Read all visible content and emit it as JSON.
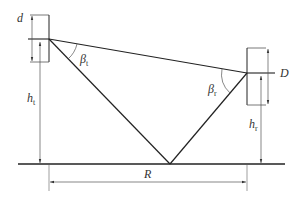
{
  "diagram": {
    "type": "two-ray ground reflection geometry",
    "labels": {
      "d": "d",
      "D": "D",
      "h_t_main": "h",
      "h_t_sub": "t",
      "h_r_main": "h",
      "h_r_sub": "r",
      "beta_t_main": "β",
      "beta_t_sub": "t",
      "beta_r_main": "β",
      "beta_r_sub": "r",
      "R": "R"
    },
    "colors": {
      "line": "#222222",
      "dimension": "#555555",
      "background": "#ffffff"
    }
  }
}
